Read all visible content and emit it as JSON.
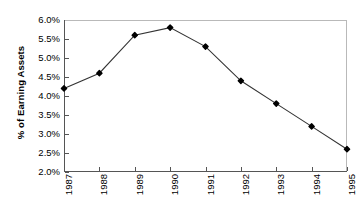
{
  "chart_data": {
    "type": "line",
    "title": "",
    "xlabel": "",
    "ylabel": "% of Earning Assets",
    "categories": [
      "1987",
      "1988",
      "1989",
      "1990",
      "1991",
      "1992",
      "1993",
      "1994",
      "1995"
    ],
    "values": [
      4.2,
      4.6,
      5.6,
      5.8,
      5.3,
      4.4,
      3.8,
      3.2,
      2.6
    ],
    "value_labels": [
      "4.2%",
      "4.6%",
      "5.6%",
      "5.8%",
      "5.3%",
      "4.4%",
      "3.8%",
      "3.2%",
      "2.6%"
    ],
    "ylim": [
      2.0,
      6.0
    ],
    "ytick_values": [
      6.0,
      5.5,
      5.0,
      4.5,
      4.0,
      3.5,
      3.0,
      2.5,
      2.0
    ],
    "ytick_labels": [
      "6.0%",
      "5.5%",
      "5.0%",
      "4.5%",
      "4.0%",
      "3.5%",
      "3.0%",
      "2.5%",
      "2.0%"
    ],
    "grid": false,
    "legend": false,
    "marker": "filled-diamond",
    "line_color": "#333333",
    "marker_color": "#000000",
    "frame_color": "#b9b9b9",
    "axis_color": "#555555",
    "background": "#ffffff"
  }
}
